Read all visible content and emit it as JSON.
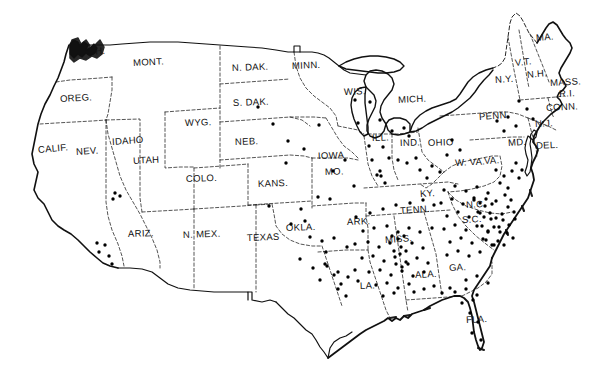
{
  "figure": {
    "kind": "dot-distribution-map",
    "region": "Contiguous United States",
    "style": "hand-drawn line map with solid dot symbols",
    "background_color": "#ffffff",
    "ink_color": "#111111",
    "dot_color": "#000000",
    "coastline_style": "solid heavy",
    "state_border_style": "dashed / thin solid"
  },
  "state_labels": [
    {
      "name": "WASH.",
      "x": 73,
      "y": 53,
      "rot": -4
    },
    {
      "name": "OREG.",
      "x": 60,
      "y": 99,
      "rot": -3
    },
    {
      "name": "CALIF.",
      "x": 38,
      "y": 150,
      "rot": -5
    },
    {
      "name": "NEV.",
      "x": 76,
      "y": 152,
      "rot": -4
    },
    {
      "name": "IDAHO",
      "x": 112,
      "y": 142,
      "rot": -4
    },
    {
      "name": "UTAH",
      "x": 133,
      "y": 161,
      "rot": -3
    },
    {
      "name": "ARIZ.",
      "x": 128,
      "y": 234,
      "rot": -2
    },
    {
      "name": "N. MEX.",
      "x": 183,
      "y": 235,
      "rot": -2
    },
    {
      "name": "MONT.",
      "x": 133,
      "y": 63,
      "rot": -3
    },
    {
      "name": "WYG.",
      "x": 185,
      "y": 123,
      "rot": -2
    },
    {
      "name": "COLO.",
      "x": 186,
      "y": 179,
      "rot": -2
    },
    {
      "name": "N. DAK.",
      "x": 232,
      "y": 68,
      "rot": -2
    },
    {
      "name": "S. DAK.",
      "x": 233,
      "y": 103,
      "rot": -2
    },
    {
      "name": "NEB.",
      "x": 235,
      "y": 142,
      "rot": -2
    },
    {
      "name": "KANS.",
      "x": 258,
      "y": 184,
      "rot": -2
    },
    {
      "name": "OKLA.",
      "x": 286,
      "y": 228,
      "rot": -2
    },
    {
      "name": "TEXAS",
      "x": 247,
      "y": 238,
      "rot": -2
    },
    {
      "name": "MINN.",
      "x": 292,
      "y": 66,
      "rot": -2
    },
    {
      "name": "IOWA",
      "x": 318,
      "y": 156,
      "rot": -2
    },
    {
      "name": "MO.",
      "x": 325,
      "y": 172,
      "rot": -2
    },
    {
      "name": "ARK.",
      "x": 347,
      "y": 222,
      "rot": -2
    },
    {
      "name": "LA.",
      "x": 360,
      "y": 286,
      "rot": -2
    },
    {
      "name": "MISS.",
      "x": 385,
      "y": 240,
      "rot": -4
    },
    {
      "name": "ALA.",
      "x": 415,
      "y": 275,
      "rot": -3
    },
    {
      "name": "TENN.",
      "x": 400,
      "y": 211,
      "rot": -4
    },
    {
      "name": "KY.",
      "x": 420,
      "y": 194,
      "rot": -4
    },
    {
      "name": "WIS.",
      "x": 344,
      "y": 92,
      "rot": -2
    },
    {
      "name": "MICH.",
      "x": 398,
      "y": 100,
      "rot": -3
    },
    {
      "name": "ILL.",
      "x": 372,
      "y": 138,
      "rot": -2
    },
    {
      "name": "IND.",
      "x": 400,
      "y": 143,
      "rot": -2
    },
    {
      "name": "OHIO",
      "x": 428,
      "y": 143,
      "rot": -2
    },
    {
      "name": "W. VA.",
      "x": 455,
      "y": 163,
      "rot": -3
    },
    {
      "name": "VA.",
      "x": 484,
      "y": 161,
      "rot": -3
    },
    {
      "name": "N.C.",
      "x": 466,
      "y": 205,
      "rot": -3
    },
    {
      "name": "S.C.",
      "x": 462,
      "y": 220,
      "rot": -3
    },
    {
      "name": "GA.",
      "x": 449,
      "y": 268,
      "rot": -3
    },
    {
      "name": "FLA.",
      "x": 466,
      "y": 320,
      "rot": -3
    },
    {
      "name": "PENN.",
      "x": 479,
      "y": 117,
      "rot": -4
    },
    {
      "name": "N.Y.",
      "x": 495,
      "y": 80,
      "rot": -4
    },
    {
      "name": "V.T.",
      "x": 515,
      "y": 63,
      "rot": -6
    },
    {
      "name": "N.H.",
      "x": 527,
      "y": 75,
      "rot": -5
    },
    {
      "name": "MA.",
      "x": 536,
      "y": 38,
      "rot": -5
    },
    {
      "name": "MASS.",
      "x": 550,
      "y": 83,
      "rot": -3
    },
    {
      "name": "R.I.",
      "x": 559,
      "y": 94,
      "rot": -3
    },
    {
      "name": "CONN.",
      "x": 546,
      "y": 108,
      "rot": -3
    },
    {
      "name": "N.J.",
      "x": 535,
      "y": 124,
      "rot": -3
    },
    {
      "name": "MD.",
      "x": 508,
      "y": 143,
      "rot": -4
    },
    {
      "name": "DEL.",
      "x": 536,
      "y": 146,
      "rot": -3
    }
  ],
  "chart_data": {
    "type": "scatter",
    "title": "",
    "xlabel": "",
    "ylabel": "",
    "symbol": "filled circle",
    "symbol_size_px": 3.4,
    "dots": [
      [
        115,
        193
      ],
      [
        120,
        196
      ],
      [
        113,
        199
      ],
      [
        97,
        243
      ],
      [
        105,
        245
      ],
      [
        99,
        252
      ],
      [
        109,
        256
      ],
      [
        112,
        264
      ],
      [
        258,
        107
      ],
      [
        273,
        124
      ],
      [
        288,
        141
      ],
      [
        286,
        163
      ],
      [
        269,
        206
      ],
      [
        301,
        209
      ],
      [
        319,
        125
      ],
      [
        304,
        149
      ],
      [
        333,
        171
      ],
      [
        345,
        160
      ],
      [
        318,
        197
      ],
      [
        330,
        199
      ],
      [
        354,
        186
      ],
      [
        310,
        237
      ],
      [
        322,
        241
      ],
      [
        334,
        238
      ],
      [
        326,
        252
      ],
      [
        347,
        247
      ],
      [
        300,
        259
      ],
      [
        313,
        268
      ],
      [
        325,
        264
      ],
      [
        338,
        272
      ],
      [
        355,
        100
      ],
      [
        370,
        102
      ],
      [
        358,
        123
      ],
      [
        380,
        120
      ],
      [
        369,
        146
      ],
      [
        383,
        147
      ],
      [
        372,
        160
      ],
      [
        389,
        158
      ],
      [
        380,
        171
      ],
      [
        377,
        175
      ],
      [
        381,
        176
      ],
      [
        385,
        183
      ],
      [
        392,
        131
      ],
      [
        404,
        128
      ],
      [
        409,
        136
      ],
      [
        398,
        160
      ],
      [
        407,
        163
      ],
      [
        416,
        158
      ],
      [
        420,
        170
      ],
      [
        432,
        166
      ],
      [
        427,
        178
      ],
      [
        440,
        172
      ],
      [
        452,
        140
      ],
      [
        460,
        150
      ],
      [
        447,
        155
      ],
      [
        356,
        217
      ],
      [
        370,
        213
      ],
      [
        383,
        209
      ],
      [
        396,
        205
      ],
      [
        410,
        203
      ],
      [
        423,
        200
      ],
      [
        434,
        205
      ],
      [
        363,
        231
      ],
      [
        374,
        228
      ],
      [
        387,
        226
      ],
      [
        398,
        232
      ],
      [
        409,
        228
      ],
      [
        420,
        232
      ],
      [
        432,
        228
      ],
      [
        355,
        244
      ],
      [
        368,
        242
      ],
      [
        379,
        247
      ],
      [
        390,
        243
      ],
      [
        401,
        247
      ],
      [
        412,
        243
      ],
      [
        423,
        248
      ],
      [
        362,
        258
      ],
      [
        373,
        256
      ],
      [
        384,
        261
      ],
      [
        395,
        257
      ],
      [
        406,
        262
      ],
      [
        417,
        258
      ],
      [
        428,
        263
      ],
      [
        369,
        272
      ],
      [
        380,
        270
      ],
      [
        391,
        275
      ],
      [
        402,
        271
      ],
      [
        413,
        276
      ],
      [
        424,
        272
      ],
      [
        376,
        285
      ],
      [
        387,
        283
      ],
      [
        398,
        288
      ],
      [
        409,
        284
      ],
      [
        392,
        236
      ],
      [
        398,
        239
      ],
      [
        404,
        236
      ],
      [
        394,
        251
      ],
      [
        400,
        254
      ],
      [
        406,
        251
      ],
      [
        396,
        264
      ],
      [
        402,
        267
      ],
      [
        408,
        264
      ],
      [
        355,
        270
      ],
      [
        348,
        277
      ],
      [
        341,
        284
      ],
      [
        358,
        281
      ],
      [
        327,
        266
      ],
      [
        334,
        275
      ],
      [
        320,
        280
      ],
      [
        444,
        190
      ],
      [
        455,
        186
      ],
      [
        466,
        191
      ],
      [
        477,
        187
      ],
      [
        488,
        193
      ],
      [
        441,
        203
      ],
      [
        452,
        199
      ],
      [
        463,
        204
      ],
      [
        474,
        200
      ],
      [
        485,
        206
      ],
      [
        496,
        201
      ],
      [
        447,
        216
      ],
      [
        458,
        212
      ],
      [
        469,
        217
      ],
      [
        480,
        213
      ],
      [
        491,
        219
      ],
      [
        502,
        214
      ],
      [
        444,
        229
      ],
      [
        455,
        225
      ],
      [
        466,
        230
      ],
      [
        477,
        226
      ],
      [
        488,
        232
      ],
      [
        499,
        227
      ],
      [
        450,
        242
      ],
      [
        461,
        238
      ],
      [
        472,
        243
      ],
      [
        483,
        239
      ],
      [
        494,
        245
      ],
      [
        447,
        255
      ],
      [
        458,
        251
      ],
      [
        469,
        256
      ],
      [
        480,
        252
      ],
      [
        474,
        198
      ],
      [
        480,
        203
      ],
      [
        486,
        199
      ],
      [
        492,
        204
      ],
      [
        478,
        212
      ],
      [
        484,
        217
      ],
      [
        490,
        213
      ],
      [
        496,
        218
      ],
      [
        482,
        226
      ],
      [
        488,
        231
      ],
      [
        494,
        227
      ],
      [
        500,
        232
      ],
      [
        486,
        240
      ],
      [
        492,
        245
      ],
      [
        498,
        241
      ],
      [
        505,
        195
      ],
      [
        511,
        200
      ],
      [
        508,
        207
      ],
      [
        514,
        212
      ],
      [
        503,
        220
      ],
      [
        509,
        225
      ],
      [
        515,
        219
      ],
      [
        507,
        233
      ],
      [
        513,
        238
      ],
      [
        504,
        245
      ],
      [
        496,
        170
      ],
      [
        504,
        176
      ],
      [
        512,
        171
      ],
      [
        500,
        183
      ],
      [
        508,
        188
      ],
      [
        516,
        163
      ],
      [
        522,
        170
      ],
      [
        519,
        178
      ],
      [
        497,
        121
      ],
      [
        508,
        117
      ],
      [
        516,
        126
      ],
      [
        504,
        131
      ],
      [
        519,
        101
      ],
      [
        527,
        109
      ],
      [
        533,
        119
      ],
      [
        466,
        280
      ],
      [
        477,
        276
      ],
      [
        488,
        283
      ],
      [
        455,
        292
      ],
      [
        466,
        289
      ],
      [
        477,
        295
      ],
      [
        462,
        303
      ],
      [
        473,
        300
      ],
      [
        470,
        313
      ],
      [
        478,
        322
      ],
      [
        472,
        333
      ],
      [
        481,
        340
      ],
      [
        434,
        286
      ],
      [
        442,
        293
      ],
      [
        450,
        288
      ],
      [
        414,
        292
      ],
      [
        424,
        289
      ],
      [
        383,
        296
      ],
      [
        394,
        293
      ],
      [
        338,
        289
      ],
      [
        346,
        296
      ],
      [
        291,
        224
      ],
      [
        305,
        221
      ]
    ],
    "legend": []
  }
}
